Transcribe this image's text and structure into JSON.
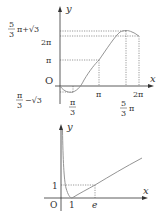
{
  "graph_top": {
    "axis_x_label": "x",
    "axis_y_label": "y",
    "origin_label": "O",
    "y_ticks": {
      "max_num": "5",
      "max_den": "3",
      "max_rest": "π+√3",
      "two_pi": "2π",
      "pi": "π",
      "min_num": "π",
      "min_den": "3",
      "min_rest": "−√3"
    },
    "x_ticks": {
      "pi3_num": "π",
      "pi3_den": "3",
      "pi": "π",
      "five_pi3_num": "5",
      "five_pi3_den": "3",
      "five_pi3_rest": "π",
      "two_pi": "2π"
    },
    "curve_color": "#888888"
  },
  "graph_bottom": {
    "axis_x_label": "x",
    "axis_y_label": "y",
    "origin_label": "O",
    "y_tick_one": "1",
    "x_tick_one": "1",
    "x_tick_e": "e",
    "curve_color": "#888888"
  }
}
